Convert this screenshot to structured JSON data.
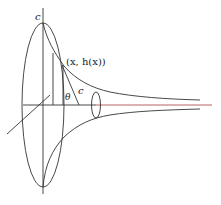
{
  "figure": {
    "labels": {
      "top_c": "c",
      "point": "(x, h(x))",
      "theta": "θ",
      "segment_c": "c"
    },
    "colors": {
      "stroke": "#333333",
      "axis_highlight": "#b05050"
    }
  }
}
